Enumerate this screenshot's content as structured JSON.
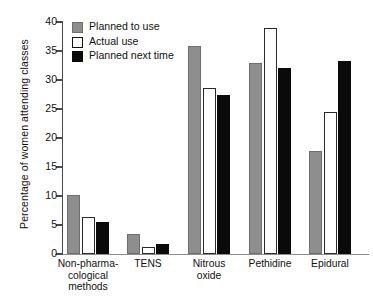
{
  "chart_data": {
    "type": "bar",
    "title": "",
    "xlabel": "",
    "ylabel": "Percentage of women attending classes",
    "ylim": [
      0,
      40
    ],
    "ytick_step": 5,
    "yticks": [
      "40",
      "35",
      "30",
      "25",
      "20",
      "15",
      "10",
      "5",
      "0"
    ],
    "grid": false,
    "legend_position": "top-left",
    "categories": [
      "Non-pharma-\ncological\nmethods",
      "TENS",
      "Nitrous\noxide",
      "Pethidine",
      "Epidural"
    ],
    "category_lines": [
      [
        "Non-pharma-",
        "cological",
        "methods"
      ],
      [
        "TENS"
      ],
      [
        "Nitrous",
        "oxide"
      ],
      [
        "Pethidine"
      ],
      [
        "Epidural"
      ]
    ],
    "series": [
      {
        "name": "Planned to use",
        "key": "planned",
        "color": "#8e8e8e",
        "values": [
          10.2,
          3.4,
          35.8,
          33.0,
          17.8
        ]
      },
      {
        "name": "Actual use",
        "key": "actual",
        "color": "#ffffff",
        "values": [
          6.4,
          1.2,
          28.6,
          39.0,
          24.5
        ]
      },
      {
        "name": "Planned next time",
        "key": "next",
        "color": "#0a0a0a",
        "values": [
          5.6,
          1.7,
          27.4,
          32.0,
          33.3
        ]
      }
    ]
  },
  "legend": {
    "items": [
      {
        "label": "Planned to use",
        "swatch": "planned"
      },
      {
        "label": "Actual use",
        "swatch": "actual"
      },
      {
        "label": "Planned next time",
        "swatch": "next"
      }
    ]
  },
  "axis": {
    "y_title": "Percentage of women attending classes"
  }
}
